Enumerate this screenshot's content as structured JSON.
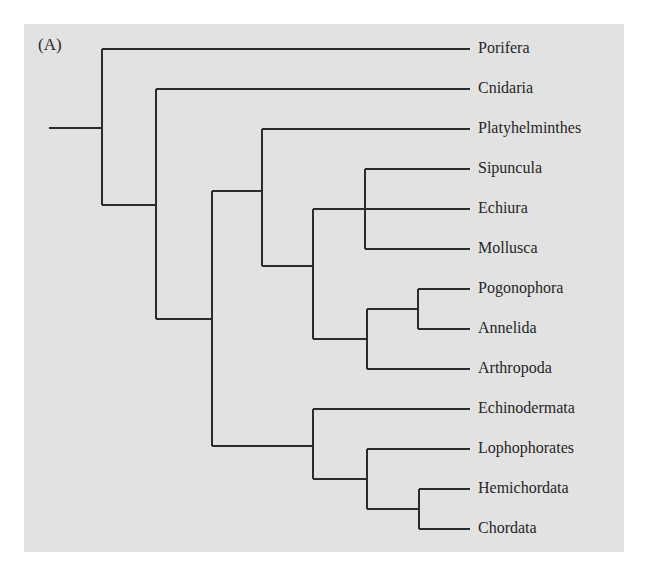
{
  "figure": {
    "panel_label": "(A)",
    "background_color": "#e2e2e2",
    "line_color": "#2b2b2b"
  },
  "taxa": [
    {
      "name": "Porifera",
      "y": 49
    },
    {
      "name": "Cnidaria",
      "y": 89
    },
    {
      "name": "Platyhelminthes",
      "y": 129
    },
    {
      "name": "Sipuncula",
      "y": 169
    },
    {
      "name": "Echiura",
      "y": 209
    },
    {
      "name": "Mollusca",
      "y": 249
    },
    {
      "name": "Pogonophora",
      "y": 289
    },
    {
      "name": "Annelida",
      "y": 329
    },
    {
      "name": "Arthropoda",
      "y": 369
    },
    {
      "name": "Echinodermata",
      "y": 409
    },
    {
      "name": "Lophophorates",
      "y": 449
    },
    {
      "name": "Hemichordata",
      "y": 489
    },
    {
      "name": "Chordata",
      "y": 529
    }
  ],
  "tree": {
    "newick": "(Porifera,(Cnidaria,((Platyhelminthes,((Sipuncula,Echiura,Mollusca),((Pogonophora,Annelida),Arthropoda))),(Echinodermata,(Lophophorates,(Hemichordata,Chordata))))));",
    "segments": [
      "M49 128 H102",
      "M102 49 V205",
      "M102 49 H470",
      "M102 205 H156",
      "M156 89 V319",
      "M156 89 H470",
      "M156 319 H212",
      "M212 191 V446",
      "M212 191 H262",
      "M262 129 V266",
      "M262 129 H470",
      "M262 266 H313",
      "M313 209 V339",
      "M313 209 H470",
      "M365 169 V249",
      "M365 169 H470",
      "M365 249 H470",
      "M313 339 H367",
      "M367 309 V369",
      "M367 309 H418",
      "M418 289 V329",
      "M418 289 H470",
      "M418 329 H470",
      "M367 369 H470",
      "M212 446 H313",
      "M313 409 V479",
      "M313 409 H470",
      "M313 479 H367",
      "M367 449 V509",
      "M367 449 H470",
      "M367 509 H419",
      "M419 489 V529",
      "M419 489 H470",
      "M419 529 H470"
    ]
  }
}
